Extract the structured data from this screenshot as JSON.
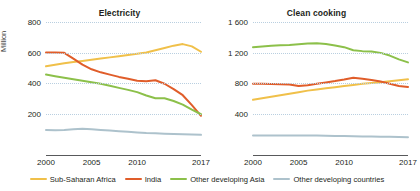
{
  "ylabel": "Million",
  "legend": [
    {
      "label": "Sub-Saharan Africa",
      "color": "#f0c04a"
    },
    {
      "label": "India",
      "color": "#e05d2a"
    },
    {
      "label": "Other developing Asia",
      "color": "#8cc04a"
    },
    {
      "label": "Other developing countries",
      "color": "#adc2cc"
    }
  ],
  "chart_data": [
    {
      "type": "line",
      "title": "Electricity",
      "xlabel": "",
      "ylabel": "Million",
      "x": [
        2000,
        2001,
        2002,
        2003,
        2004,
        2005,
        2006,
        2007,
        2008,
        2009,
        2010,
        2011,
        2012,
        2013,
        2014,
        2015,
        2016,
        2017
      ],
      "xlim": [
        2000,
        2017
      ],
      "ylim": [
        0,
        800
      ],
      "yticks": [
        200,
        400,
        600,
        800
      ],
      "ytick_labels": [
        "200",
        "400",
        "600",
        "800"
      ],
      "xticks": [
        2000,
        2005,
        2010,
        2017
      ],
      "xtick_labels": [
        "2000",
        "2005",
        "2010",
        "2017"
      ],
      "grid": true,
      "legend_position": "bottom",
      "series": [
        {
          "name": "Sub-Saharan Africa",
          "color": "#f0c04a",
          "values": [
            510,
            520,
            530,
            538,
            545,
            552,
            560,
            568,
            576,
            584,
            592,
            600,
            615,
            630,
            645,
            655,
            640,
            605
          ]
        },
        {
          "name": "India",
          "color": "#e05d2a",
          "values": [
            600,
            600,
            598,
            560,
            520,
            490,
            470,
            455,
            440,
            428,
            415,
            412,
            418,
            395,
            360,
            320,
            255,
            185
          ]
        },
        {
          "name": "Other developing Asia",
          "color": "#8cc04a",
          "values": [
            455,
            445,
            435,
            425,
            415,
            405,
            395,
            382,
            368,
            355,
            340,
            318,
            300,
            300,
            282,
            258,
            225,
            195
          ]
        },
        {
          "name": "Other developing countries",
          "color": "#adc2cc",
          "values": [
            92,
            90,
            92,
            96,
            100,
            96,
            92,
            88,
            84,
            80,
            76,
            72,
            70,
            68,
            66,
            64,
            62,
            60
          ]
        }
      ]
    },
    {
      "type": "line",
      "title": "Clean cooking",
      "xlabel": "",
      "ylabel": "",
      "x": [
        2000,
        2001,
        2002,
        2003,
        2004,
        2005,
        2006,
        2007,
        2008,
        2009,
        2010,
        2011,
        2012,
        2013,
        2014,
        2015,
        2016,
        2017
      ],
      "xlim": [
        2000,
        2017
      ],
      "ylim": [
        0,
        1600
      ],
      "yticks": [
        400,
        800,
        1200,
        1600
      ],
      "ytick_labels": [
        "400",
        "800",
        "1 200",
        "1 600"
      ],
      "xticks": [
        2000,
        2005,
        2010,
        2017
      ],
      "xtick_labels": [
        "2000",
        "2005",
        "2010",
        "2017"
      ],
      "grid": true,
      "legend_position": "bottom",
      "series": [
        {
          "name": "Sub-Saharan Africa",
          "color": "#f0c04a",
          "values": [
            580,
            600,
            620,
            640,
            660,
            680,
            700,
            715,
            730,
            745,
            760,
            775,
            790,
            800,
            810,
            822,
            835,
            848
          ]
        },
        {
          "name": "India",
          "color": "#e05d2a",
          "values": [
            790,
            790,
            788,
            785,
            780,
            760,
            772,
            790,
            808,
            825,
            845,
            868,
            855,
            840,
            820,
            790,
            760,
            748
          ]
        },
        {
          "name": "Other developing Asia",
          "color": "#8cc04a",
          "values": [
            1270,
            1280,
            1288,
            1295,
            1300,
            1308,
            1318,
            1320,
            1310,
            1292,
            1270,
            1230,
            1218,
            1212,
            1195,
            1160,
            1110,
            1070
          ]
        },
        {
          "name": "Other developing countries",
          "color": "#adc2cc",
          "values": [
            110,
            110,
            110,
            110,
            110,
            110,
            110,
            110,
            108,
            106,
            104,
            102,
            100,
            98,
            96,
            94,
            92,
            90
          ]
        }
      ]
    }
  ]
}
